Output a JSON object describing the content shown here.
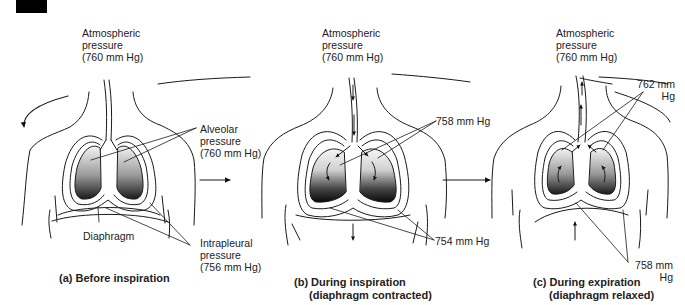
{
  "figure": {
    "panels": [
      {
        "id": "a",
        "caption": "(a) Before inspiration",
        "atmospheric": [
          "Atmospheric",
          "pressure",
          "(760 mm Hg)"
        ],
        "alveolar": [
          "Alveolar",
          "pressure",
          "(760 mm Hg)"
        ],
        "diaphragm_label": "Diaphragm",
        "intrapleural": [
          "Intrapleural",
          "pressure",
          "(756 mm Hg)"
        ]
      },
      {
        "id": "b",
        "caption_line1": "(b) During inspiration",
        "caption_line2": "(diaphragm contracted)",
        "atmospheric": [
          "Atmospheric",
          "pressure",
          "(760 mm Hg)"
        ],
        "alveolar_value": "758 mm Hg",
        "intrapleural_value": "754 mm Hg"
      },
      {
        "id": "c",
        "caption_line1": "(c) During expiration",
        "caption_line2": "(diaphragm relaxed)",
        "atmospheric": [
          "Atmospheric",
          "pressure",
          "(760 mm Hg)"
        ],
        "alveolar_value": [
          "762 mm",
          "Hg"
        ],
        "intrapleural_value": [
          "758 mm",
          "Hg"
        ]
      }
    ],
    "colors": {
      "line": "#1a1a1a",
      "lung_light": "#f2f2f2",
      "lung_dark": "#111111"
    }
  }
}
